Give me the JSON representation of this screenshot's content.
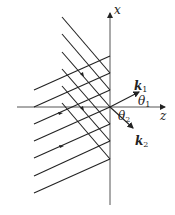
{
  "diagram": {
    "labels": {
      "x_axis": "x",
      "z_axis": "z",
      "k1": "k",
      "k1_sub": "1",
      "k2": "k",
      "k2_sub": "2",
      "theta1": "θ",
      "theta1_sub": "1",
      "theta2": "θ",
      "theta2_sub": "2"
    },
    "colors": {
      "line": "#222222",
      "axis": "#555555"
    },
    "incident_wavefront_count": 7,
    "reflected_wavefront_count": 6
  }
}
